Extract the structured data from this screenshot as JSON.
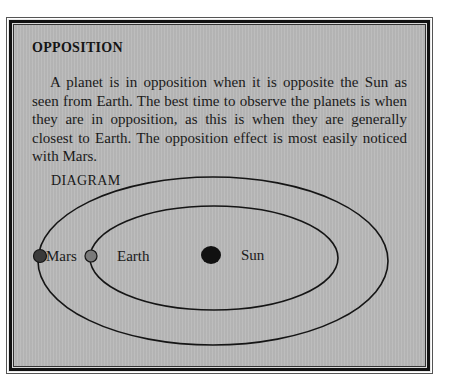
{
  "panel": {
    "title": "OPPOSITION",
    "body": "A planet is in opposition when it is opposite the Sun as seen from Earth. The best time to observe the planets is when they are in opposition, as this is when they are generally closest to Earth. The opposition effect is most easily noticed with Mars.",
    "background_color": "#b9b9b9"
  },
  "diagram": {
    "heading": "DIAGRAM",
    "orbits": [
      {
        "name": "Mars orbit",
        "cx": 213,
        "cy": 261,
        "rx": 175,
        "ry": 84
      },
      {
        "name": "Earth orbit",
        "cx": 214,
        "cy": 258,
        "rx": 124,
        "ry": 52
      }
    ],
    "bodies": [
      {
        "name": "Mars",
        "label": "Mars",
        "color": "#3a3a3a"
      },
      {
        "name": "Earth",
        "label": "Earth",
        "color": "#7a7a7a"
      },
      {
        "name": "Sun",
        "label": "Sun",
        "color": "#111111"
      }
    ]
  }
}
